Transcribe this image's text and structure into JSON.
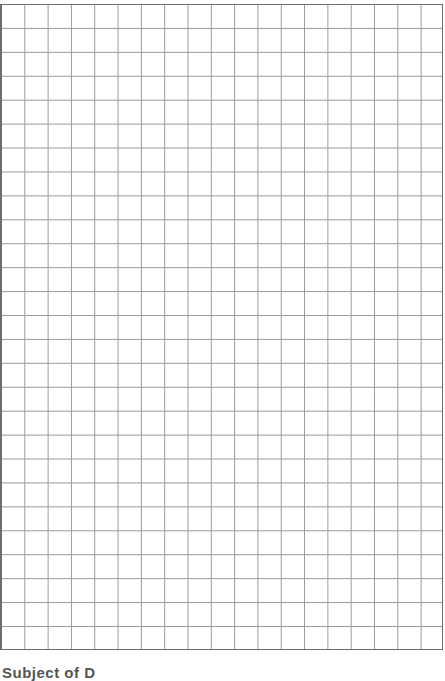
{
  "document": {
    "type": "graph-paper",
    "grid": {
      "columns": 19,
      "rows": 27,
      "line_color": "#9a9a9a",
      "border_color": "#6e6e6e"
    },
    "footer": {
      "text": "Subject of D"
    }
  }
}
